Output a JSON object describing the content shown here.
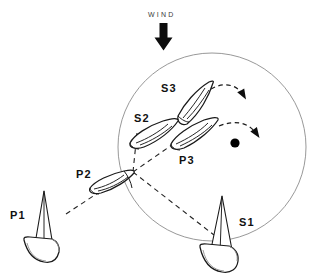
{
  "diagram": {
    "wind": {
      "label": "WIND",
      "direction": "down",
      "arrow_icon": "down-arrow-icon"
    },
    "zone": {
      "name": "mark-zone-circle",
      "center_x": 212,
      "center_y": 147,
      "radius": 94,
      "stroke_color": "#8c8c8c"
    },
    "mark": {
      "name": "racing-mark",
      "x": 235,
      "y": 143,
      "radius": 4.6,
      "color": "#000000"
    },
    "boats": [
      {
        "id": "P1",
        "label": "P1",
        "view": "perspective",
        "label_x": 10,
        "label_y": 219,
        "hull_x": 62,
        "hull_y": 222
      },
      {
        "id": "P2",
        "label": "P2",
        "view": "overhead",
        "label_x": 76,
        "label_y": 178,
        "hull_x": 108,
        "hull_y": 188
      },
      {
        "id": "P3",
        "label": "P3",
        "view": "overhead",
        "label_x": 179,
        "label_y": 164,
        "hull_x": 197,
        "hull_y": 135
      },
      {
        "id": "S1",
        "label": "S1",
        "view": "perspective",
        "label_x": 239,
        "label_y": 226,
        "hull_x": 219,
        "hull_y": 236
      },
      {
        "id": "S2",
        "label": "S2",
        "view": "overhead",
        "label_x": 134,
        "label_y": 122,
        "hull_x": 155,
        "hull_y": 139
      },
      {
        "id": "S3",
        "label": "S3",
        "view": "overhead",
        "label_x": 161,
        "label_y": 92,
        "hull_x": 190,
        "hull_y": 110
      }
    ],
    "track_lines": [
      {
        "name": "p1-to-p2-track",
        "from": "P1",
        "to": "P2"
      },
      {
        "name": "p2-to-p3-track",
        "from": "P2",
        "to": "P3"
      },
      {
        "name": "p2-to-s2-track",
        "from": "P2",
        "to": "S2"
      },
      {
        "name": "s1-to-p2-track",
        "from": "S1",
        "to": "P2"
      }
    ],
    "turn_arrows": [
      {
        "name": "s3-turn-arrow",
        "icon": "curved-arrow-icon"
      },
      {
        "name": "p3-turn-arrow",
        "icon": "curved-arrow-icon"
      }
    ],
    "colors": {
      "ink": "#1a1a1a",
      "zone_stroke": "#8c8c8c",
      "mark_fill": "#000000",
      "background": "#ffffff"
    }
  }
}
